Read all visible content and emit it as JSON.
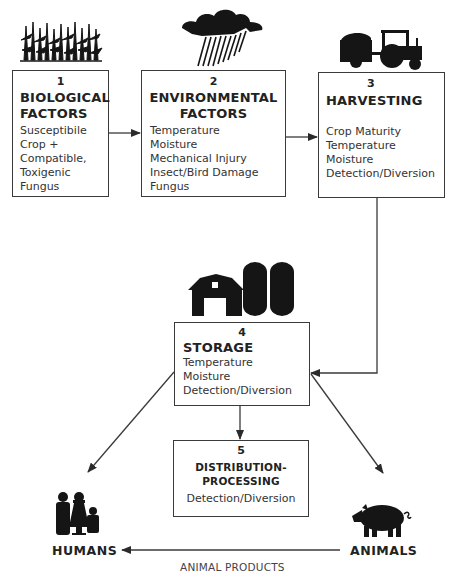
{
  "diagram": {
    "colors": {
      "line": "#3a3a3a",
      "icon": "#151515",
      "text": "#2a2a2a"
    },
    "boxes": [
      {
        "id": "biological",
        "number": "1",
        "title_lines": [
          "BIOLOGICAL",
          "FACTORS"
        ],
        "items": [
          "Susceptibile",
          "Crop +",
          "Compatible,",
          "Toxigenic",
          "Fungus"
        ],
        "icon": "corn-field-icon"
      },
      {
        "id": "environmental",
        "number": "2",
        "title_lines": [
          "ENVIRONMENTAL",
          "FACTORS"
        ],
        "items": [
          "Temperature",
          "Moisture",
          "Mechanical Injury",
          "Insect/Bird Damage",
          "Fungus"
        ],
        "icon": "rain-cloud-icon"
      },
      {
        "id": "harvesting",
        "number": "3",
        "title_lines": [
          "HARVESTING"
        ],
        "items": [
          "Crop Maturity",
          "Temperature",
          "Moisture",
          "Detection/Diversion"
        ],
        "icon": "tractor-wagon-icon"
      },
      {
        "id": "storage",
        "number": "4",
        "title_lines": [
          "STORAGE"
        ],
        "items": [
          "Temperature",
          "Moisture",
          "Detection/Diversion"
        ],
        "icon": "barn-silo-icon"
      },
      {
        "id": "distribution",
        "number": "5",
        "title_lines": [
          "DISTRIBUTION-",
          "PROCESSING"
        ],
        "items": [
          "Detection/Diversion"
        ],
        "icon": null
      }
    ],
    "endpoints": {
      "humans": {
        "label": "HUMANS",
        "icon": "family-icon"
      },
      "animals": {
        "label": "ANIMALS",
        "icon": "pig-icon"
      }
    },
    "edges": [
      {
        "from": "1",
        "to": "2"
      },
      {
        "from": "2",
        "to": "3"
      },
      {
        "from": "3",
        "to": "4"
      },
      {
        "from": "4",
        "to": "5"
      },
      {
        "from": "4",
        "to": "humans"
      },
      {
        "from": "4",
        "to": "animals"
      },
      {
        "from": "animals",
        "to": "humans",
        "label": "ANIMAL PRODUCTS"
      }
    ],
    "edge_label_animal_products": "ANIMAL PRODUCTS"
  }
}
